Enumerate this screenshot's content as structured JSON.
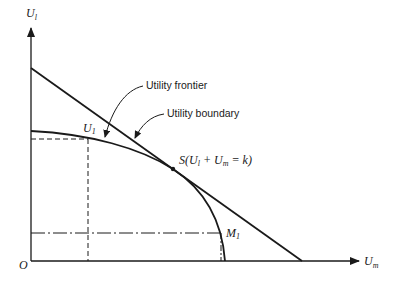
{
  "diagram": {
    "type": "utility-possibility-frontier",
    "axes": {
      "y_label": "U",
      "y_label_sub": "l",
      "x_label": "U",
      "x_label_sub": "m",
      "origin_label": "O"
    },
    "labels": {
      "frontier": "Utility frontier",
      "boundary": "Utility boundary",
      "point_u1": "U",
      "point_u1_sub": "1",
      "point_m1": "M",
      "point_m1_sub": "1",
      "tangent_point": "S(U",
      "tangent_sub_l": "l",
      "tangent_plus": " + U",
      "tangent_sub_m": "m",
      "tangent_rest": " = k)"
    },
    "colors": {
      "ink": "#1a1a1a",
      "background": "#ffffff"
    }
  }
}
